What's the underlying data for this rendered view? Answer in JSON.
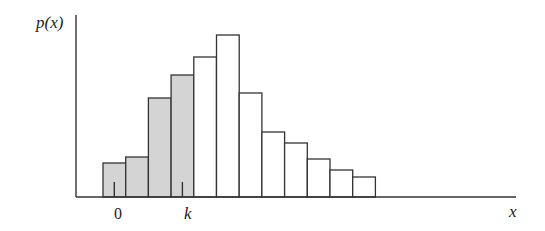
{
  "chart_data": {
    "type": "bar",
    "title": "",
    "xlabel": "x",
    "ylabel": "p(x)",
    "grid": false,
    "legend": null,
    "x_tick_labels": [
      {
        "label": "0",
        "bar_index": 0
      },
      {
        "label": "k",
        "bar_index": 3
      }
    ],
    "bars": [
      {
        "index": 0,
        "height": 34,
        "shaded": true
      },
      {
        "index": 1,
        "height": 40,
        "shaded": true
      },
      {
        "index": 2,
        "height": 99,
        "shaded": true
      },
      {
        "index": 3,
        "height": 122,
        "shaded": true
      },
      {
        "index": 4,
        "height": 140,
        "shaded": false
      },
      {
        "index": 5,
        "height": 162,
        "shaded": false
      },
      {
        "index": 6,
        "height": 104,
        "shaded": false
      },
      {
        "index": 7,
        "height": 65,
        "shaded": false
      },
      {
        "index": 8,
        "height": 54,
        "shaded": false
      },
      {
        "index": 9,
        "height": 38,
        "shaded": false
      },
      {
        "index": 10,
        "height": 27,
        "shaded": false
      },
      {
        "index": 11,
        "height": 20,
        "shaded": false
      }
    ],
    "values": [
      34,
      40,
      99,
      122,
      140,
      162,
      104,
      65,
      54,
      38,
      27,
      20
    ],
    "annotations": [
      "Shaded bars from 0 through k represent cumulative probability P(X ≤ k)"
    ],
    "colors": {
      "shaded": "#d4d4d4",
      "unshaded": "#ffffff",
      "stroke": "#333333"
    }
  },
  "labels": {
    "y_axis": "p(x)",
    "x_axis": "x",
    "tick_zero": "0",
    "tick_k": "k"
  }
}
